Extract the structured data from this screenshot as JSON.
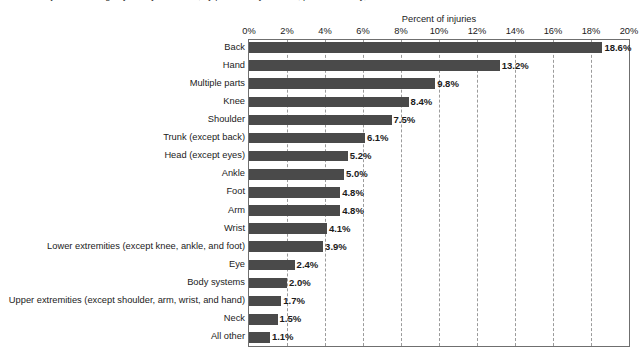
{
  "report": {
    "title": "Percent of injuries involving days away from work, by part of body affected, private industry, 2001"
  },
  "chart_data": {
    "type": "bar",
    "orientation": "horizontal",
    "title": "",
    "xlabel": "Percent of injuries",
    "ylabel": "",
    "xlim": [
      0,
      20
    ],
    "xtick_step": 2,
    "xtick_labels": [
      "0%",
      "2%",
      "4%",
      "6%",
      "8%",
      "10%",
      "12%",
      "14%",
      "16%",
      "18%",
      "20%"
    ],
    "xtick_values": [
      0,
      2,
      4,
      6,
      8,
      10,
      12,
      14,
      16,
      18,
      20
    ],
    "grid": "vertical-dashed",
    "legend": "none",
    "bar_color": "#4a4a4a",
    "categories": [
      "Back",
      "Hand",
      "Multiple parts",
      "Knee",
      "Shoulder",
      "Trunk (except back)",
      "Head (except eyes)",
      "Ankle",
      "Foot",
      "Arm",
      "Wrist",
      "Lower extremities (except knee, ankle, and foot)",
      "Eye",
      "Body systems",
      "Upper extremities (except shoulder, arm, wrist, and hand)",
      "Neck",
      "All other"
    ],
    "values": [
      18.6,
      13.2,
      9.8,
      8.4,
      7.5,
      6.1,
      5.2,
      5.0,
      4.8,
      4.8,
      4.1,
      3.9,
      2.4,
      2.0,
      1.7,
      1.5,
      1.1
    ],
    "value_labels": [
      "18.6%",
      "13.2%",
      "9.8%",
      "8.4%",
      "7.5%",
      "6.1%",
      "5.2%",
      "5.0%",
      "4.8%",
      "4.8%",
      "4.1%",
      "3.9%",
      "2.4%",
      "2.0%",
      "1.7%",
      "1.5%",
      "1.1%"
    ]
  }
}
